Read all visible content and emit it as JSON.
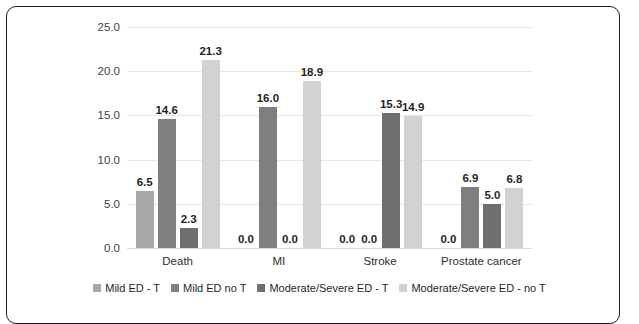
{
  "figure": {
    "border_color": "#1b1b1b"
  },
  "chart_data": {
    "type": "bar",
    "title": "",
    "subtitle": "",
    "xlabel": "",
    "ylabel": "Percent %",
    "ylim": [
      0,
      25
    ],
    "ytick_labels": [
      "0.0",
      "5.0",
      "10.0",
      "15.0",
      "20.0",
      "25.0"
    ],
    "ytick_values": [
      0,
      5,
      10,
      15,
      20,
      25
    ],
    "grid": true,
    "grid_axis": "y",
    "legend_position": "bottom",
    "categories": [
      "Death",
      "MI",
      "Stroke",
      "Prostate cancer"
    ],
    "series": [
      {
        "name": "Mild ED - T",
        "color": "#a8a8a8",
        "values": [
          6.5,
          0.0,
          0.0,
          0.0
        ],
        "labels": [
          "6.5",
          "0.0",
          "0.0",
          "0.0"
        ]
      },
      {
        "name": "Mild ED no T",
        "color": "#7f7f7f",
        "values": [
          14.6,
          16.0,
          0.0,
          6.9
        ],
        "labels": [
          "14.6",
          "16.0",
          "0.0",
          "6.9"
        ]
      },
      {
        "name": "Moderate/Severe ED - T",
        "color": "#6f6f6f",
        "values": [
          2.3,
          0.0,
          15.3,
          5.0
        ],
        "labels": [
          "2.3",
          "0.0",
          "15.3",
          "5.0"
        ]
      },
      {
        "name": "Moderate/Severe ED - no T",
        "color": "#d2d2d2",
        "values": [
          21.3,
          18.9,
          14.9,
          6.8
        ],
        "labels": [
          "21.3",
          "18.9",
          "14.9",
          "6.8"
        ]
      }
    ]
  }
}
